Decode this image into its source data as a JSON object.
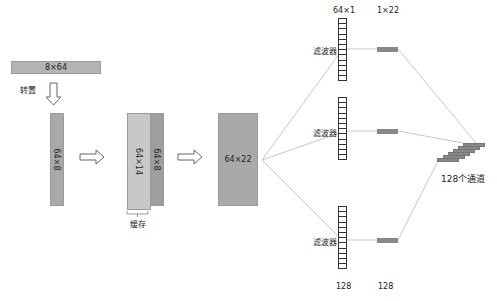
{
  "input": {
    "label": "8×64",
    "color": "#b4b4b4"
  },
  "transpose": {
    "label": "转置"
  },
  "transposed": {
    "label": "64×8",
    "color": "#a9a9a9"
  },
  "concat": {
    "cache_label": "64×14",
    "cache_color": "#c8c8c8",
    "new_label": "64×8",
    "new_color": "#9e9e9e",
    "brace_label": "缓存"
  },
  "combined": {
    "label": "64×22",
    "color": "#a9a9a9"
  },
  "filters": {
    "label": "滤波器",
    "top_dim_label": "64×1",
    "output_dim_label": "1×22",
    "count_label_filters": "128",
    "count_label_outputs": "128",
    "cells_per_filter": 12
  },
  "output": {
    "label": "128个通道",
    "bar_color": "#888888"
  }
}
